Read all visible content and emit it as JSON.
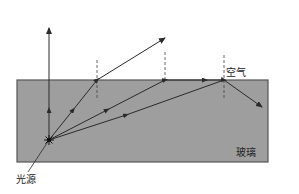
{
  "labels": {
    "air": "空气",
    "glass": "玻璃",
    "light_source": "光源"
  },
  "colors": {
    "glass_fill": "#9e9e9e",
    "glass_border": "#555555",
    "ray": "#2a2a2a",
    "normal": "#444444",
    "background": "#ffffff"
  },
  "geometry": {
    "glass_block": {
      "x": 17,
      "y": 80,
      "width": 251,
      "height": 82
    },
    "source": {
      "x": 49,
      "y": 140
    },
    "rays": [
      {
        "name": "normal-incidence",
        "incident_to": [
          49,
          80
        ],
        "exit_to": [
          49,
          28
        ]
      },
      {
        "name": "refracted",
        "incident_to": [
          97,
          80
        ],
        "exit_to": [
          165,
          38
        ]
      },
      {
        "name": "critical-angle",
        "incident_to": [
          165,
          80
        ],
        "exit_to": [
          224,
          80
        ]
      },
      {
        "name": "total-internal-reflection",
        "incident_to": [
          224,
          80
        ],
        "exit_to": [
          262,
          107
        ]
      }
    ],
    "normals": [
      {
        "x": 97,
        "y1": 60,
        "y2": 100
      },
      {
        "x": 165,
        "y1": 52,
        "y2": 80
      },
      {
        "x": 224,
        "y1": 55,
        "y2": 100
      }
    ]
  }
}
